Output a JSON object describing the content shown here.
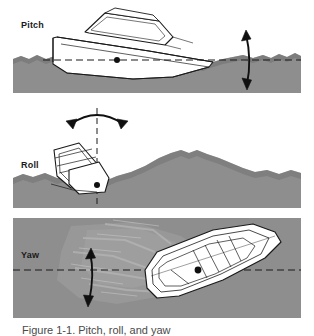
{
  "figure": {
    "caption_partial": "Figure 1-1. Pitch, roll, and yaw",
    "colors": {
      "water": "#8e8e8e",
      "water_shade_dark": "#6f6f6f",
      "water_shade_light": "#a8a8a8",
      "hull_fill": "#ffffff",
      "outline": "#1a1a1a",
      "page_background": "#ffffff",
      "label_text": "#1a1a1a"
    },
    "panels": [
      {
        "id": "pitch",
        "label": "Pitch",
        "view": "side profile",
        "axis_style": "horizontal dashed line",
        "arrow": "vertical double-headed arrow",
        "center_of_gravity_marker": "black dot"
      },
      {
        "id": "roll",
        "label": "Roll",
        "view": "stern / head-on",
        "axis_style": "vertical dashed line",
        "arrow": "curved double-headed arc arrow",
        "center_of_gravity_marker": "black dot"
      },
      {
        "id": "yaw",
        "label": "Yaw",
        "view": "top-down / overhead",
        "axis_style": "horizontal dashed line",
        "arrow": "vertical double-headed arrow",
        "center_of_gravity_marker": "black dot"
      }
    ]
  }
}
